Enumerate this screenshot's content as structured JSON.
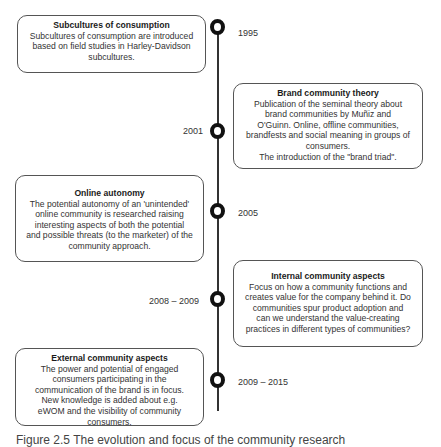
{
  "timeline": {
    "events": [
      {
        "year": "1995",
        "title": "Subcultures of consumption",
        "body": "Subcultures of consumption are introduced\nbased on field studies in Harley-Davidson\nsubcultures."
      },
      {
        "year": "2001",
        "title": "Brand community theory",
        "body": "Publication of the seminal theory about\nbrand communities by Muñiz and\nO'Guinn. Online, offline communities,\nbrandfests and social meaning in groups of\nconsumers.\nThe introduction of the \"brand triad\"."
      },
      {
        "year": "2005",
        "title": "Online autonomy",
        "body": "The potential autonomy of an 'unintended'\nonline community is researched raising\ninteresting aspects of both the potential\nand possible threats (to the marketer) of the\ncommunity approach."
      },
      {
        "year": "2008 – 2009",
        "title": "Internal community aspects",
        "body": "Focus on how a community functions and\ncreates value for the company behind it. Do\ncommunities spur product adoption and\ncan we understand the value-creating\npractices in different types of communities?"
      },
      {
        "year": "2009 – 2015",
        "title": "External community aspects",
        "body": "The power and potential of engaged\nconsumers participating in the\ncommunication of the brand is in focus.\nNew knowledge is added about e.g.\neWOM and the visibility of community\nconsumers."
      }
    ]
  },
  "caption": "Figure 2.5 The evolution and focus of the community research"
}
